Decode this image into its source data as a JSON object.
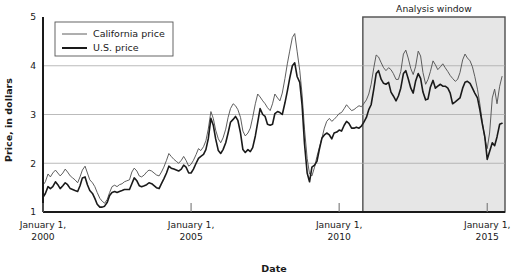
{
  "chart_data": {
    "type": "line",
    "title": "",
    "xlabel": "Date",
    "ylabel": "Price, in dollars",
    "xlim": [
      2000.0,
      2015.6
    ],
    "ylim": [
      1,
      5
    ],
    "grid": true,
    "grid_axis": "y",
    "legend_position": "top-left",
    "y_ticks": [
      "1",
      "2",
      "3",
      "4",
      "5"
    ],
    "y_tick_values": [
      1,
      2,
      3,
      4,
      5
    ],
    "x_ticks": [
      {
        "value": 2000,
        "line1": "January 1,",
        "line2": "2000"
      },
      {
        "value": 2005,
        "line1": "January 1,",
        "line2": "2005"
      },
      {
        "value": 2010,
        "line1": "January 1,",
        "line2": "2010"
      },
      {
        "value": 2015,
        "line1": "January 1,",
        "line2": "2015"
      }
    ],
    "annotations": [
      {
        "name": "analysis-window",
        "label": "Analysis window",
        "type": "shaded-span",
        "x_start": 2010.8,
        "x_end": 2015.6,
        "fill": "#e6e6e6",
        "border": "#4d4d4d"
      }
    ],
    "series": [
      {
        "name": "California price",
        "color": "#4d4d4d",
        "width": 0.9,
        "x": [
          2000.0,
          2000.08,
          2000.17,
          2000.25,
          2000.33,
          2000.42,
          2000.5,
          2000.58,
          2000.67,
          2000.75,
          2000.83,
          2000.92,
          2001.0,
          2001.08,
          2001.17,
          2001.25,
          2001.33,
          2001.42,
          2001.5,
          2001.58,
          2001.67,
          2001.75,
          2001.83,
          2001.92,
          2002.0,
          2002.08,
          2002.17,
          2002.25,
          2002.33,
          2002.42,
          2002.5,
          2002.58,
          2002.67,
          2002.75,
          2002.83,
          2002.92,
          2003.0,
          2003.08,
          2003.17,
          2003.25,
          2003.33,
          2003.42,
          2003.5,
          2003.58,
          2003.67,
          2003.75,
          2003.83,
          2003.92,
          2004.0,
          2004.08,
          2004.17,
          2004.25,
          2004.33,
          2004.42,
          2004.5,
          2004.58,
          2004.67,
          2004.75,
          2004.83,
          2004.92,
          2005.0,
          2005.08,
          2005.17,
          2005.25,
          2005.33,
          2005.42,
          2005.5,
          2005.58,
          2005.67,
          2005.75,
          2005.83,
          2005.92,
          2006.0,
          2006.08,
          2006.17,
          2006.25,
          2006.33,
          2006.42,
          2006.5,
          2006.58,
          2006.67,
          2006.75,
          2006.83,
          2006.92,
          2007.0,
          2007.08,
          2007.17,
          2007.25,
          2007.33,
          2007.42,
          2007.5,
          2007.58,
          2007.67,
          2007.75,
          2007.83,
          2007.92,
          2008.0,
          2008.08,
          2008.17,
          2008.25,
          2008.33,
          2008.42,
          2008.5,
          2008.58,
          2008.67,
          2008.75,
          2008.83,
          2008.92,
          2009.0,
          2009.08,
          2009.17,
          2009.25,
          2009.33,
          2009.42,
          2009.5,
          2009.58,
          2009.67,
          2009.75,
          2009.83,
          2009.92,
          2010.0,
          2010.08,
          2010.17,
          2010.25,
          2010.33,
          2010.42,
          2010.5,
          2010.58,
          2010.67,
          2010.75,
          2010.83,
          2010.92,
          2011.0,
          2011.08,
          2011.17,
          2011.25,
          2011.33,
          2011.42,
          2011.5,
          2011.58,
          2011.67,
          2011.75,
          2011.83,
          2011.92,
          2012.0,
          2012.08,
          2012.17,
          2012.25,
          2012.33,
          2012.42,
          2012.5,
          2012.58,
          2012.67,
          2012.75,
          2012.83,
          2012.92,
          2013.0,
          2013.08,
          2013.17,
          2013.25,
          2013.33,
          2013.42,
          2013.5,
          2013.58,
          2013.67,
          2013.75,
          2013.83,
          2013.92,
          2014.0,
          2014.08,
          2014.17,
          2014.25,
          2014.33,
          2014.42,
          2014.5,
          2014.58,
          2014.67,
          2014.75,
          2014.83,
          2014.92,
          2015.0,
          2015.08,
          2015.17,
          2015.25,
          2015.33,
          2015.42,
          2015.5
        ],
        "values": [
          1.55,
          1.62,
          1.78,
          1.72,
          1.8,
          1.86,
          1.8,
          1.74,
          1.8,
          1.88,
          1.82,
          1.74,
          1.7,
          1.66,
          1.6,
          1.72,
          1.86,
          1.94,
          1.8,
          1.66,
          1.6,
          1.52,
          1.4,
          1.28,
          1.22,
          1.18,
          1.26,
          1.4,
          1.52,
          1.55,
          1.52,
          1.56,
          1.58,
          1.62,
          1.64,
          1.66,
          1.82,
          1.9,
          1.84,
          1.74,
          1.72,
          1.76,
          1.82,
          1.86,
          1.84,
          1.8,
          1.76,
          1.74,
          1.82,
          1.92,
          2.06,
          2.2,
          2.14,
          2.08,
          2.04,
          2.0,
          2.06,
          2.14,
          2.06,
          1.94,
          1.98,
          2.06,
          2.18,
          2.3,
          2.26,
          2.34,
          2.46,
          2.7,
          3.06,
          2.92,
          2.68,
          2.5,
          2.42,
          2.52,
          2.7,
          2.94,
          3.12,
          3.22,
          3.18,
          3.1,
          2.94,
          2.66,
          2.56,
          2.62,
          2.72,
          2.94,
          3.22,
          3.42,
          3.36,
          3.28,
          3.22,
          3.14,
          3.08,
          3.22,
          3.42,
          3.34,
          3.28,
          3.44,
          3.74,
          4.04,
          4.3,
          4.58,
          4.66,
          4.3,
          3.9,
          3.4,
          2.7,
          2.1,
          1.78,
          1.74,
          1.92,
          2.14,
          2.32,
          2.52,
          2.72,
          2.86,
          2.92,
          2.86,
          2.9,
          2.96,
          3.02,
          3.04,
          3.12,
          3.2,
          3.14,
          3.08,
          3.1,
          3.14,
          3.18,
          3.16,
          3.22,
          3.3,
          3.42,
          3.62,
          3.96,
          4.22,
          4.18,
          4.06,
          3.96,
          3.9,
          3.96,
          3.92,
          3.84,
          3.72,
          3.72,
          3.88,
          4.24,
          4.32,
          4.16,
          3.94,
          3.82,
          3.98,
          4.3,
          4.2,
          3.86,
          3.62,
          3.72,
          3.88,
          4.1,
          4.02,
          3.92,
          3.98,
          4.04,
          3.96,
          3.88,
          3.8,
          3.74,
          3.68,
          3.72,
          3.86,
          4.12,
          4.24,
          4.16,
          4.1,
          3.98,
          3.78,
          3.52,
          3.22,
          2.86,
          2.5,
          2.3,
          2.62,
          3.34,
          3.52,
          3.22,
          3.58,
          3.78
        ]
      },
      {
        "name": "U.S. price",
        "color": "#1a1a1a",
        "width": 1.6,
        "x": [
          2000.0,
          2000.08,
          2000.17,
          2000.25,
          2000.33,
          2000.42,
          2000.5,
          2000.58,
          2000.67,
          2000.75,
          2000.83,
          2000.92,
          2001.0,
          2001.08,
          2001.17,
          2001.25,
          2001.33,
          2001.42,
          2001.5,
          2001.58,
          2001.67,
          2001.75,
          2001.83,
          2001.92,
          2002.0,
          2002.08,
          2002.17,
          2002.25,
          2002.33,
          2002.42,
          2002.5,
          2002.58,
          2002.67,
          2002.75,
          2002.83,
          2002.92,
          2003.0,
          2003.08,
          2003.17,
          2003.25,
          2003.33,
          2003.42,
          2003.5,
          2003.58,
          2003.67,
          2003.75,
          2003.83,
          2003.92,
          2004.0,
          2004.08,
          2004.17,
          2004.25,
          2004.33,
          2004.42,
          2004.5,
          2004.58,
          2004.67,
          2004.75,
          2004.83,
          2004.92,
          2005.0,
          2005.08,
          2005.17,
          2005.25,
          2005.33,
          2005.42,
          2005.5,
          2005.58,
          2005.67,
          2005.75,
          2005.83,
          2005.92,
          2006.0,
          2006.08,
          2006.17,
          2006.25,
          2006.33,
          2006.42,
          2006.5,
          2006.58,
          2006.67,
          2006.75,
          2006.83,
          2006.92,
          2007.0,
          2007.08,
          2007.17,
          2007.25,
          2007.33,
          2007.42,
          2007.5,
          2007.58,
          2007.67,
          2007.75,
          2007.83,
          2007.92,
          2008.0,
          2008.08,
          2008.17,
          2008.25,
          2008.33,
          2008.42,
          2008.5,
          2008.58,
          2008.67,
          2008.75,
          2008.83,
          2008.92,
          2009.0,
          2009.08,
          2009.17,
          2009.25,
          2009.33,
          2009.42,
          2009.5,
          2009.58,
          2009.67,
          2009.75,
          2009.83,
          2009.92,
          2010.0,
          2010.08,
          2010.17,
          2010.25,
          2010.33,
          2010.42,
          2010.5,
          2010.58,
          2010.67,
          2010.75,
          2010.83,
          2010.92,
          2011.0,
          2011.08,
          2011.17,
          2011.25,
          2011.33,
          2011.42,
          2011.5,
          2011.58,
          2011.67,
          2011.75,
          2011.83,
          2011.92,
          2012.0,
          2012.08,
          2012.17,
          2012.25,
          2012.33,
          2012.42,
          2012.5,
          2012.58,
          2012.67,
          2012.75,
          2012.83,
          2012.92,
          2013.0,
          2013.08,
          2013.17,
          2013.25,
          2013.33,
          2013.42,
          2013.5,
          2013.58,
          2013.67,
          2013.75,
          2013.83,
          2013.92,
          2014.0,
          2014.08,
          2014.17,
          2014.25,
          2014.33,
          2014.42,
          2014.5,
          2014.58,
          2014.67,
          2014.75,
          2014.83,
          2014.92,
          2015.0,
          2015.08,
          2015.17,
          2015.25,
          2015.33,
          2015.42,
          2015.5
        ],
        "values": [
          1.3,
          1.38,
          1.52,
          1.48,
          1.52,
          1.62,
          1.56,
          1.48,
          1.54,
          1.6,
          1.56,
          1.48,
          1.46,
          1.44,
          1.42,
          1.54,
          1.7,
          1.72,
          1.56,
          1.44,
          1.38,
          1.28,
          1.16,
          1.1,
          1.1,
          1.12,
          1.2,
          1.34,
          1.4,
          1.42,
          1.4,
          1.42,
          1.44,
          1.46,
          1.46,
          1.46,
          1.58,
          1.7,
          1.64,
          1.54,
          1.52,
          1.54,
          1.56,
          1.6,
          1.58,
          1.54,
          1.5,
          1.48,
          1.58,
          1.68,
          1.8,
          1.94,
          1.9,
          1.88,
          1.86,
          1.84,
          1.88,
          1.96,
          1.92,
          1.8,
          1.8,
          1.88,
          2.0,
          2.1,
          2.14,
          2.18,
          2.28,
          2.5,
          2.92,
          2.78,
          2.5,
          2.26,
          2.2,
          2.28,
          2.42,
          2.62,
          2.84,
          2.9,
          2.96,
          2.88,
          2.62,
          2.28,
          2.22,
          2.28,
          2.24,
          2.32,
          2.56,
          2.84,
          3.12,
          3.0,
          2.96,
          2.8,
          2.78,
          2.8,
          3.02,
          3.06,
          3.04,
          3.0,
          3.24,
          3.48,
          3.74,
          4.0,
          4.06,
          3.78,
          3.66,
          3.18,
          2.4,
          1.8,
          1.62,
          1.92,
          1.96,
          2.04,
          2.28,
          2.52,
          2.58,
          2.62,
          2.58,
          2.5,
          2.62,
          2.64,
          2.68,
          2.66,
          2.78,
          2.86,
          2.82,
          2.72,
          2.72,
          2.74,
          2.72,
          2.76,
          2.84,
          2.94,
          3.1,
          3.2,
          3.52,
          3.84,
          3.9,
          3.72,
          3.64,
          3.62,
          3.66,
          3.46,
          3.38,
          3.28,
          3.38,
          3.54,
          3.84,
          3.9,
          3.74,
          3.54,
          3.44,
          3.68,
          3.84,
          3.74,
          3.46,
          3.3,
          3.32,
          3.56,
          3.7,
          3.54,
          3.58,
          3.62,
          3.58,
          3.58,
          3.54,
          3.44,
          3.22,
          3.26,
          3.3,
          3.34,
          3.54,
          3.66,
          3.68,
          3.64,
          3.54,
          3.44,
          3.34,
          3.1,
          2.82,
          2.54,
          2.08,
          2.24,
          2.42,
          2.36,
          2.54,
          2.8,
          2.82
        ]
      }
    ]
  },
  "legend": {
    "items": [
      {
        "label": "California price",
        "swatch": "thin-line",
        "color": "#4d4d4d"
      },
      {
        "label": "U.S. price",
        "swatch": "thick-line",
        "color": "#1a1a1a"
      }
    ]
  },
  "colors": {
    "plot_border": "#1a1a1a",
    "gridline": "#aaaaaa",
    "shade_fill": "#e6e6e6",
    "shade_border": "#4d4d4d",
    "background": "#ffffff",
    "text": "#1a1a1a"
  }
}
